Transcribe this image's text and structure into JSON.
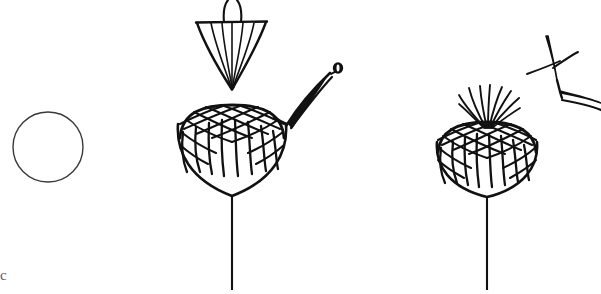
{
  "figure": {
    "background_color": "#ffffff",
    "ink_color": "#1a1a1a",
    "faint_ink_color": "#5a5a5a",
    "width": 601,
    "height": 294,
    "corner_mark_text": "c",
    "elements": [
      {
        "name": "circle-outline",
        "label": "Plain circle outline",
        "center_x": 48,
        "center_y": 147,
        "radius": 35,
        "stroke_width": 1.4,
        "filled": false
      },
      {
        "name": "inverted-cone",
        "label": "Inverted ribbed cone with two curved filaments",
        "top_bar_y": 22,
        "top_bar_x_start": 196,
        "top_bar_x_end": 267,
        "apex_x": 232,
        "apex_y": 89,
        "rib_count": 5,
        "filament_count": 2
      },
      {
        "name": "flower-head-left",
        "label": "Cross-hatched dome flower head on stem",
        "center_x": 232,
        "head_top_y": 105,
        "cup_bottom_y": 196,
        "stem_x": 232,
        "stem_bottom_y": 290,
        "has_bristles": false
      },
      {
        "name": "leaf-blade",
        "label": "Curved leaf blade with bead at tip",
        "tip_x": 337,
        "tip_y": 70,
        "base_x": 286,
        "base_y": 126,
        "bead_radius": 5
      },
      {
        "name": "flower-head-right",
        "label": "Cross-hatched dome flower head with upright bristles on stem",
        "center_x": 487,
        "head_top_y": 122,
        "cup_bottom_y": 196,
        "stem_x": 487,
        "stem_bottom_y": 290,
        "has_bristles": true,
        "bristle_count": 9
      },
      {
        "name": "forked-twig",
        "label": "Angular forked twig, upper right",
        "vertex_x": 556,
        "vertex_y": 80,
        "branch_count": 4
      }
    ]
  }
}
